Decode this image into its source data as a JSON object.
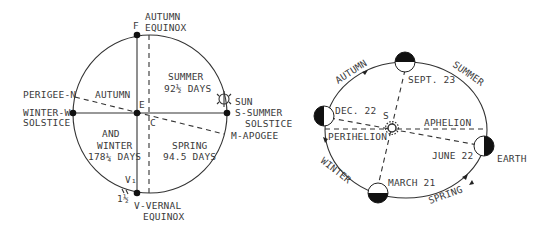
{
  "left_diagram": {
    "labels": {
      "f": "F",
      "autumn_equinox_1": "AUTUMN",
      "autumn_equinox_2": "EQUINOX",
      "summer_1": "SUMMER",
      "summer_2": "92½ DAYS",
      "perigee": "PERIGEE-N",
      "autumn": "AUTUMN",
      "winter_solstice_1": "WINTER-W",
      "winter_solstice_2": "SOLSTICE",
      "e": "E",
      "c": "C",
      "sun": "SUN",
      "summer_solstice_1": "S-SUMMER",
      "summer_solstice_2": "SOLSTICE",
      "apogee": "M-APOGEE",
      "and": "AND",
      "winter_1": "WINTER",
      "winter_2": "178¼ DAYS",
      "spring_1": "SPRING",
      "spring_2": "94.5 DAYS",
      "v1": "V₁",
      "one_half": "1½",
      "vernal_equinox_1": "V-VERNAL",
      "vernal_equinox_2": "EQUINOX"
    }
  },
  "right_diagram": {
    "labels": {
      "autumn": "AUTUMN",
      "summer": "SUMMER",
      "sept": "SEPT. 23",
      "dec": "DEC. 22",
      "s": "S",
      "aphelion": "APHELION",
      "perihelion": "PERIHELION",
      "june": "JUNE 22",
      "earth": "EARTH",
      "winter": "WINTER",
      "march": "MARCH 21",
      "spring": "SPRING"
    }
  }
}
